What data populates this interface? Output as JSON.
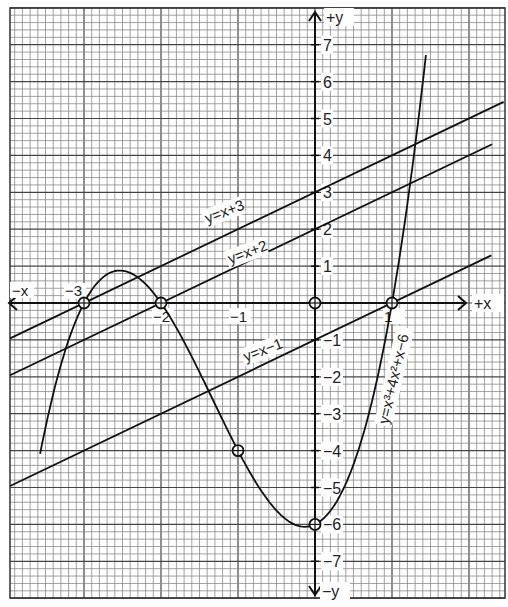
{
  "chart_data": {
    "type": "line",
    "title": "",
    "xlabel": "x",
    "ylabel": "y",
    "xlim": [
      -4,
      2.4
    ],
    "ylim": [
      -8,
      8
    ],
    "grid": true,
    "axis_labels": {
      "x_pos": "+x",
      "x_neg": "−x",
      "y_pos": "+y",
      "y_neg": "−y"
    },
    "x_ticks": [
      {
        "value": -3,
        "label": "−3"
      },
      {
        "value": -2,
        "label": "−2"
      },
      {
        "value": -1,
        "label": "−1"
      },
      {
        "value": 1,
        "label": "1"
      }
    ],
    "y_ticks": [
      {
        "value": 7,
        "label": "7"
      },
      {
        "value": 6,
        "label": "6"
      },
      {
        "value": 5,
        "label": "5"
      },
      {
        "value": 4,
        "label": "4"
      },
      {
        "value": 3,
        "label": "3"
      },
      {
        "value": 2,
        "label": "2"
      },
      {
        "value": 1,
        "label": "1"
      },
      {
        "value": -1,
        "label": "−1"
      },
      {
        "value": -2,
        "label": "−2"
      },
      {
        "value": -3,
        "label": "−3"
      },
      {
        "value": -4,
        "label": "−4"
      },
      {
        "value": -5,
        "label": "−5"
      },
      {
        "value": -6,
        "label": "−6"
      },
      {
        "value": -7,
        "label": "−7"
      }
    ],
    "series": [
      {
        "name": "y=x³+4x²+x−6",
        "label": "y=x³+4x²+x−6",
        "kind": "cubic",
        "coefficients": [
          1,
          4,
          1,
          -6
        ],
        "x_range": [
          -3.57,
          1.44
        ],
        "label_pos": {
          "x": 0.95,
          "y": -3.3,
          "rotate": -77
        }
      },
      {
        "name": "y=x+3",
        "label": "y=x+3",
        "kind": "linear",
        "coefficients": [
          1,
          3
        ],
        "x_range": [
          -3.96,
          2.45
        ],
        "label_pos": {
          "x": -1.4,
          "y": 2.15,
          "rotate": -21
        }
      },
      {
        "name": "y=x+2",
        "label": "y=x+2",
        "kind": "linear",
        "coefficients": [
          1,
          2
        ],
        "x_range": [
          -3.96,
          2.3
        ],
        "label_pos": {
          "x": -1.1,
          "y": 1.05,
          "rotate": -21
        }
      },
      {
        "name": "y=x−1",
        "label": "y=x−1",
        "kind": "linear",
        "coefficients": [
          1,
          -1
        ],
        "x_range": [
          -3.96,
          2.29
        ],
        "label_pos": {
          "x": -0.9,
          "y": -1.6,
          "rotate": -21
        }
      }
    ],
    "marked_points": [
      {
        "x": -3,
        "y": 0
      },
      {
        "x": -2,
        "y": 0
      },
      {
        "x": 0,
        "y": 0
      },
      {
        "x": 1,
        "y": 0
      },
      {
        "x": -1,
        "y": -4
      },
      {
        "x": 0,
        "y": -6
      }
    ]
  }
}
